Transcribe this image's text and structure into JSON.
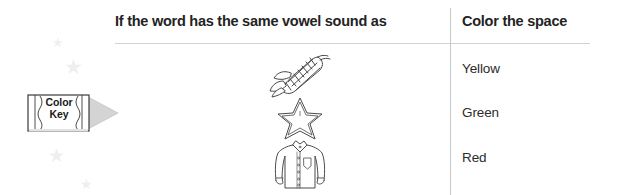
{
  "worksheet": {
    "columns": {
      "word_header": "If the word has the same vowel sound as",
      "color_header": "Color the space"
    },
    "color_key": {
      "line1": "Color",
      "line2": "Key",
      "icon": "crayon-icon"
    },
    "rows": [
      {
        "picture_icon": "corn-icon",
        "picture_name": "corn",
        "color": "Yellow"
      },
      {
        "picture_icon": "star-icon",
        "picture_name": "star",
        "color": "Green"
      },
      {
        "picture_icon": "shirt-icon",
        "picture_name": "shirt",
        "color": "Red"
      }
    ],
    "decorations": {
      "star_glyph": "★",
      "stars": [
        {
          "x": 52,
          "y": 36,
          "size": 13
        },
        {
          "x": 64,
          "y": 56,
          "size": 21
        },
        {
          "x": 48,
          "y": 146,
          "size": 19
        },
        {
          "x": 80,
          "y": 177,
          "size": 14
        }
      ]
    },
    "colors": {
      "text": "#232323",
      "rule": "#d2d2d2",
      "divider": "#c9c9c9",
      "deco_star": "#efefef",
      "crayon_tip": "#cfcfcf",
      "line_art": "#4a4a4a"
    }
  }
}
